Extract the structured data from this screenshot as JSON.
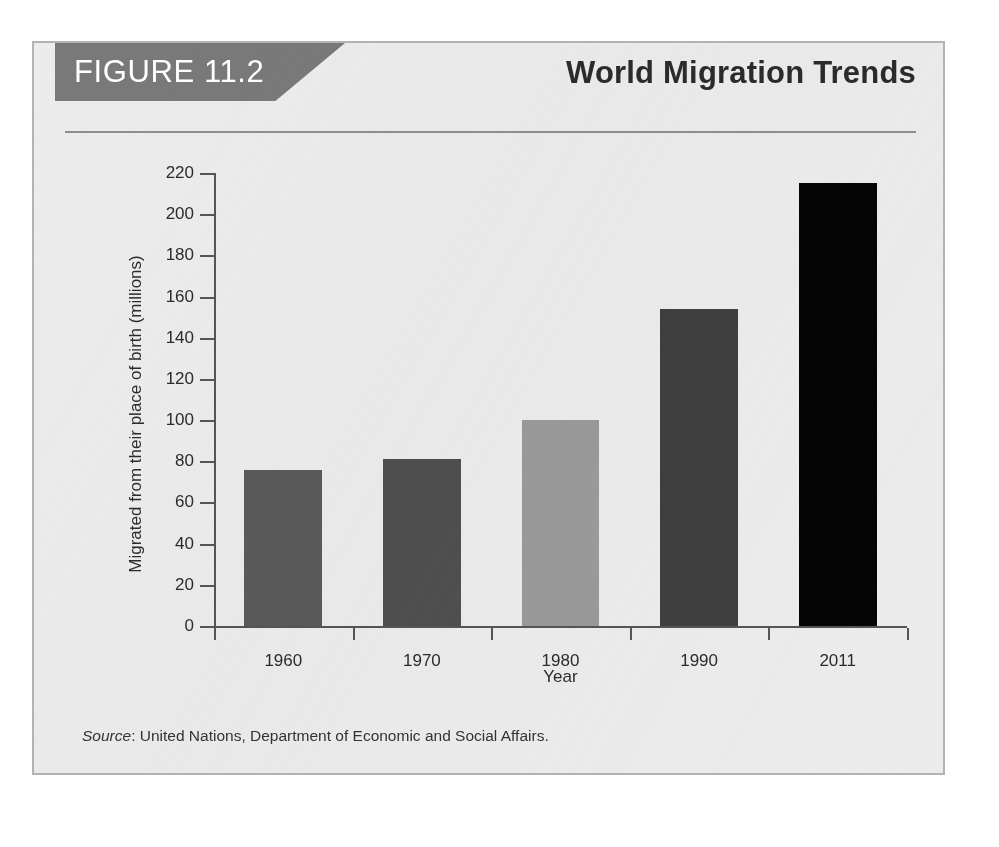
{
  "figure": {
    "label": "FIGURE 11.2",
    "title": "World Migration Trends",
    "source_word": "Source",
    "source_text": ": United Nations, Department of Economic and Social Affairs.",
    "banner_color": "#797979",
    "panel_color": "#ececec",
    "border_color": "#b3b3b3"
  },
  "chart_data": {
    "type": "bar",
    "title": "World Migration Trends",
    "xlabel": "Year",
    "ylabel": "Migrated from their place of birth (millions)",
    "categories": [
      "1960",
      "1970",
      "1980",
      "1990",
      "2011"
    ],
    "values": [
      76,
      81,
      100,
      154,
      215
    ],
    "bar_colors": [
      "#5a5a5a",
      "#4f4f4f",
      "#9a9a9a",
      "#3f3f3f",
      "#050505"
    ],
    "ylim": [
      0,
      220
    ],
    "yticks": [
      0,
      20,
      40,
      60,
      80,
      100,
      120,
      140,
      160,
      180,
      200,
      220
    ],
    "ytick_labels": [
      "0",
      "20",
      "40",
      "60",
      "80",
      "100",
      "120",
      "140",
      "160",
      "180",
      "200",
      "220"
    ],
    "grid": false,
    "legend": null
  }
}
